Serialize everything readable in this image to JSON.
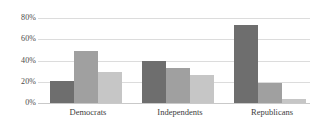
{
  "chart_data": {
    "type": "bar",
    "title": "",
    "subtitle": "",
    "xlabel": "",
    "ylabel": "",
    "categories": [
      "Democrats",
      "Independents",
      "Republicans"
    ],
    "series": [
      {
        "name": "series-1",
        "color": "#6e6e6e",
        "values": [
          21,
          40,
          73
        ]
      },
      {
        "name": "series-2",
        "color": "#a0a0a0",
        "values": [
          49,
          33,
          19
        ]
      },
      {
        "name": "series-3",
        "color": "#c6c6c6",
        "values": [
          29,
          26,
          4
        ]
      }
    ],
    "ylim": [
      0,
      80
    ],
    "yticks": [
      0,
      20,
      40,
      60,
      80
    ],
    "ytick_labels": [
      "0%",
      "20%",
      "40%",
      "60%",
      "80%"
    ],
    "grid": true,
    "legend": "none",
    "gridline_color": "#dcdcdc",
    "background": "#ffffff"
  },
  "axis": {
    "y": {
      "labels": [
        "80%",
        "60%",
        "40%",
        "20%",
        "0%"
      ]
    },
    "x": {
      "labels": [
        "Democrats",
        "Independents",
        "Republicans"
      ]
    }
  }
}
